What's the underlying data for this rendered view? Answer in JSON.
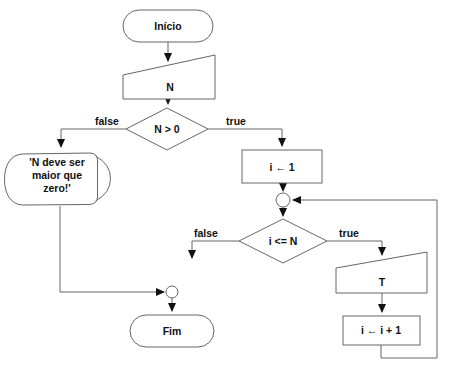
{
  "diagram": {
    "nodes": {
      "start": {
        "type": "terminator",
        "label": "Início"
      },
      "read_n": {
        "type": "manual-input",
        "label": "N"
      },
      "check_n": {
        "type": "decision",
        "label": "N > 0"
      },
      "error_msg": {
        "type": "display",
        "lines": [
          "'N deve ser",
          "maior que",
          "zero!'"
        ]
      },
      "init_i": {
        "type": "process",
        "label": "i ← 1"
      },
      "junction_top": {
        "type": "connector"
      },
      "check_loop": {
        "type": "decision",
        "label": "i <= N"
      },
      "read_t": {
        "type": "manual-input",
        "label": "T"
      },
      "increment_i": {
        "type": "process",
        "label": "i ← i + 1"
      },
      "junction_bottom": {
        "type": "connector"
      },
      "end": {
        "type": "terminator",
        "label": "Fim"
      }
    },
    "edge_labels": {
      "check_n_false": "false",
      "check_n_true": "true",
      "check_loop_false": "false",
      "check_loop_true": "true"
    },
    "colors": {
      "stroke": "#666666",
      "arrow": "#111111",
      "text": "#111111",
      "fill": "#ffffff",
      "background": "#ffffff"
    }
  }
}
